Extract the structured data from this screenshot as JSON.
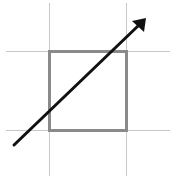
{
  "diagram": {
    "colors": {
      "grid": "#c8c8c8",
      "square": "#8a8a8a",
      "arrow": "#111111"
    },
    "grid": {
      "vertical_x": [
        49,
        126
      ],
      "horizontal_y": [
        51,
        130
      ]
    },
    "square": {
      "x": 49,
      "y": 51,
      "width": 77,
      "height": 79
    },
    "arrow": {
      "x1": 14,
      "y1": 145,
      "x2": 145,
      "y2": 19
    }
  }
}
